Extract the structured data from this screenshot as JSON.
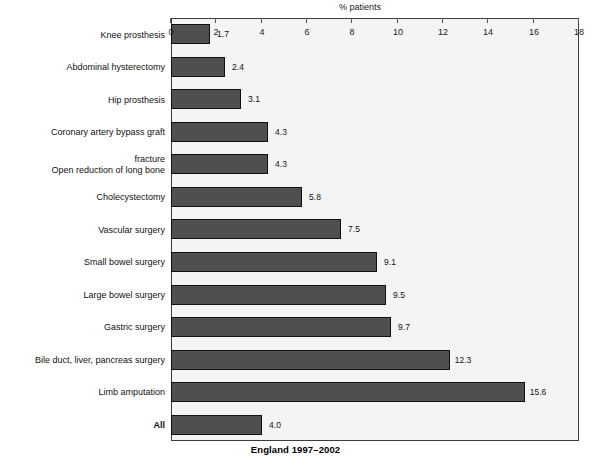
{
  "chart_data": {
    "type": "bar",
    "orientation": "horizontal",
    "title": "England 1997–2002",
    "xlabel": "% patients",
    "ylabel": "",
    "xlim": [
      0,
      18
    ],
    "xticks": [
      0,
      2,
      4,
      6,
      8,
      10,
      12,
      14,
      16,
      18
    ],
    "grid": false,
    "legend": null,
    "bar_color": "#4f4f4f",
    "plot_background": "#f4f4f4",
    "categories": [
      "All",
      "Limb amputation",
      "Bile duct, liver, pancreas surgery",
      "Gastric surgery",
      "Large bowel surgery",
      "Small bowel surgery",
      "Vascular surgery",
      "Cholecystectomy",
      "Open reduction of long bone\nfracture",
      "Coronary artery bypass graft",
      "Hip prosthesis",
      "Abdominal hysterectomy",
      "Knee prosthesis"
    ],
    "values": [
      4.0,
      15.6,
      12.3,
      9.7,
      9.5,
      9.1,
      7.5,
      5.8,
      4.3,
      4.3,
      3.1,
      2.4,
      1.7
    ],
    "value_labels": [
      "4.0",
      "15.6",
      "12.3",
      "9.7",
      "9.5",
      "9.1",
      "7.5",
      "5.8",
      "4.3",
      "4.3",
      "3.1",
      "2.4",
      "1.7"
    ],
    "emphasized_categories": [
      "All"
    ]
  },
  "rotation": {
    "note": "figure-rendered-upside-down",
    "degrees": 180
  }
}
